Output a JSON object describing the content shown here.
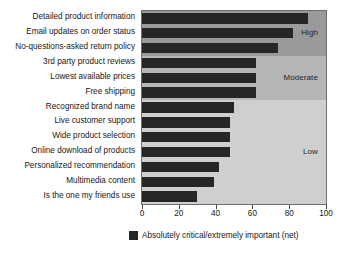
{
  "chart_data": {
    "type": "bar",
    "orientation": "horizontal",
    "title": "",
    "xlabel": "",
    "ylabel": "",
    "xlim": [
      0,
      100
    ],
    "xticks": [
      0,
      20,
      40,
      60,
      80,
      100
    ],
    "grid": false,
    "legend": {
      "position": "bottom-left",
      "entries": [
        {
          "label": "Absolutely critical/extremely important (net)",
          "color": "#262626"
        }
      ]
    },
    "categories": [
      "Detailed product information",
      "Email updates on order status",
      "No-questions-asked return policy",
      "3rd party product reviews",
      "Lowest available prices",
      "Free shipping",
      "Recognized brand name",
      "Live customer support",
      "Wide product selection",
      "Online download of products",
      "Personalized recommendation",
      "Multimedia content",
      "Is the one my friends use"
    ],
    "values": [
      90,
      82,
      74,
      62,
      62,
      62,
      50,
      48,
      48,
      48,
      42,
      39,
      30
    ],
    "bands": [
      {
        "label": "High",
        "start_index": 0,
        "end_index": 2,
        "color": "#9a9a9a"
      },
      {
        "label": "Moderate",
        "start_index": 3,
        "end_index": 5,
        "color": "#b6b6b6"
      },
      {
        "label": "Low",
        "start_index": 6,
        "end_index": 12,
        "color": "#cfcfcf"
      }
    ],
    "bar_color": "#262626"
  }
}
